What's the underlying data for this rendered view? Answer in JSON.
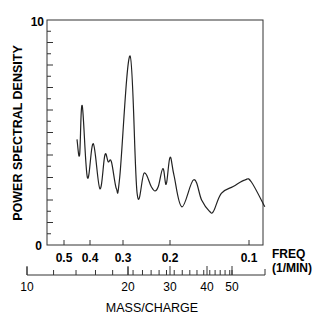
{
  "chart_data": {
    "type": "line",
    "title": "",
    "ylabel": "POWER SPECTRAL DENSITY",
    "ylim": [
      0,
      10
    ],
    "y_ticks_labeled": [
      "0",
      "10"
    ],
    "y_minor_tick_step": 0.5,
    "xlabel_primary": "FREQ (1/MIN)",
    "x_primary_ticks": [
      "0.5",
      "0.4",
      "0.3",
      "0.2",
      "0.1"
    ],
    "x_primary_tick_values": [
      0.5,
      0.4,
      0.3,
      0.2,
      0.1
    ],
    "xlabel_secondary": "MASS/CHARGE",
    "x_secondary_ticks": [
      "10",
      "20",
      "30",
      "40",
      "50"
    ],
    "x_secondary_tick_values": [
      10,
      20,
      30,
      40,
      50
    ],
    "grid": false,
    "legend": null,
    "series": [
      {
        "name": "Power spectral density",
        "x_freq": [
          0.45,
          0.44,
          0.43,
          0.41,
          0.39,
          0.37,
          0.355,
          0.345,
          0.335,
          0.32,
          0.31,
          0.285,
          0.27,
          0.255,
          0.24,
          0.232,
          0.225,
          0.215,
          0.208,
          0.2,
          0.195,
          0.185,
          0.17,
          0.16,
          0.15,
          0.145,
          0.135,
          0.12,
          0.105,
          0.097,
          0.08
        ],
        "y": [
          4.7,
          4.0,
          6.2,
          3.0,
          4.5,
          2.5,
          4.0,
          3.7,
          3.7,
          2.5,
          3.0,
          8.4,
          2.3,
          3.2,
          2.6,
          2.4,
          2.6,
          3.4,
          2.7,
          3.9,
          3.1,
          1.7,
          2.9,
          2.0,
          1.5,
          1.5,
          2.3,
          2.6,
          2.9,
          2.8,
          1.7
        ]
      }
    ],
    "annotations": []
  },
  "axes": {
    "y_title": "POWER SPECTRAL DENSITY",
    "y_top": "10",
    "y_bottom": "0",
    "freq_label_line1": "FREQ",
    "freq_label_line2": "(1/MIN)",
    "mass_title": "MASS/CHARGE"
  }
}
